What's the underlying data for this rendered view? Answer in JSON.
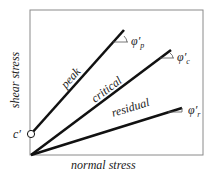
{
  "diagram": {
    "axes": {
      "x_label": "normal stress",
      "y_label": "shear stress"
    },
    "intercept_label": "c′",
    "lines": [
      {
        "name": "peak",
        "label": "peak",
        "angle_symbol": "φ′",
        "angle_sub": "p"
      },
      {
        "name": "critical",
        "label": "critical",
        "angle_symbol": "φ′",
        "angle_sub": "c"
      },
      {
        "name": "residual",
        "label": "residual",
        "angle_symbol": "φ′",
        "angle_sub": "r"
      }
    ],
    "colors": {
      "frame": "#888888",
      "line": "#111111"
    }
  }
}
